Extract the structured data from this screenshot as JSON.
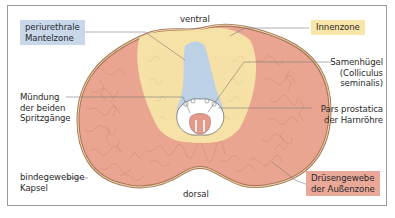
{
  "figure": {
    "orientation": {
      "top": "ventral",
      "bottom": "dorsal"
    },
    "labels": {
      "periurethral": {
        "lines": [
          "periurethrale",
          "Mantelzone"
        ],
        "color": "#c8d8ea"
      },
      "inner_zone": {
        "lines": [
          "Innenzone"
        ],
        "color": "#f8e6a8"
      },
      "colliculus": {
        "lines": [
          "Samenhügel",
          "(Colliculus",
          "seminalis)"
        ]
      },
      "ejaculatory": {
        "lines": [
          "Mündung",
          "der beiden",
          "Spritzgänge"
        ]
      },
      "urethra": {
        "lines": [
          "Pars prostatica",
          "der Harnröhre"
        ]
      },
      "capsule": {
        "lines": [
          "bindegewebige",
          "Kapsel"
        ]
      },
      "outer_zone": {
        "lines": [
          "Drüsengewebe",
          "der Außenzone"
        ],
        "color": "#eaa898"
      }
    },
    "colors": {
      "outer": "#eaa592",
      "outer_texture": "#c97d6e",
      "inner": "#f6e2a6",
      "periurethral": "#bcd0e6",
      "capsule": "#a77a55",
      "leader": "#7a7a7a"
    }
  }
}
